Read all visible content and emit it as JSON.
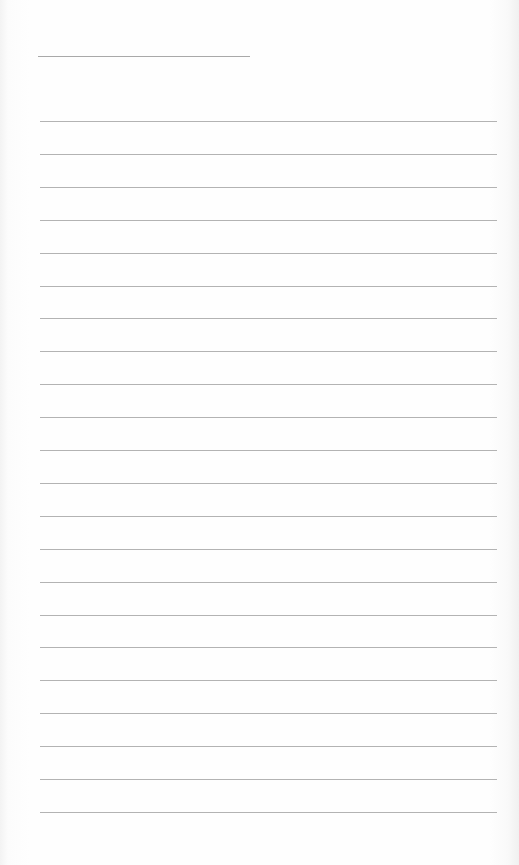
{
  "document": {
    "type": "ruled notepaper sheet",
    "background_color": "#fdfdfd",
    "line_color": "#a0a0a0",
    "header_line": {
      "x1": 38,
      "x2": 250,
      "y": 56
    },
    "ruled_lines": {
      "count": 22,
      "x1": 40,
      "x2": 497,
      "first_y": 121,
      "spacing": 32.9
    },
    "text_content": ""
  }
}
